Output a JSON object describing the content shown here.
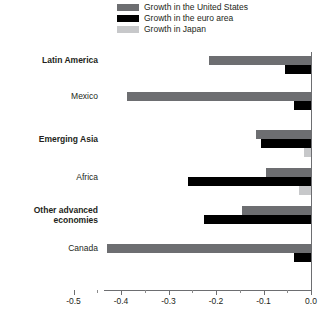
{
  "chart_data": {
    "type": "bar",
    "orientation": "horizontal",
    "title": "",
    "subtitle": "",
    "xlabel": "",
    "ylabel": "",
    "xlim": [
      -0.5,
      0.0
    ],
    "grid": false,
    "legend_position": "top-center",
    "xticks": [
      -0.5,
      -0.4,
      -0.3,
      -0.2,
      -0.1,
      0.0
    ],
    "xtick_labels": [
      "-0.5",
      "-0.4",
      "-0.3",
      "-0.2",
      "-0.1",
      "0.0"
    ],
    "xticks_minor": [
      -0.45,
      -0.35,
      -0.25,
      -0.15,
      -0.05
    ],
    "categories": [
      "Latin America",
      "Mexico",
      "Emerging Asia",
      "Africa",
      "Other advanced economies",
      "Canada"
    ],
    "category_styles": [
      "bold",
      "regular",
      "bold",
      "regular",
      "bold",
      "regular"
    ],
    "series": [
      {
        "name": "Growth in the United States",
        "color": "#6d6e71",
        "values": [
          -0.215,
          -0.387,
          -0.115,
          -0.095,
          -0.145,
          -0.43
        ]
      },
      {
        "name": "Growth in the euro area",
        "color": "#000000",
        "values": [
          -0.055,
          -0.035,
          -0.105,
          -0.26,
          -0.225,
          -0.035
        ]
      },
      {
        "name": "Growth in Japan",
        "color": "#c7c8ca",
        "values": [
          0.0,
          0.0,
          -0.015,
          -0.025,
          0.0,
          0.0
        ]
      }
    ]
  },
  "legend": {
    "items": [
      {
        "label": "Growth in the United States",
        "color": "#6d6e71"
      },
      {
        "label": "Growth in the euro area",
        "color": "#000000"
      },
      {
        "label": "Growth in Japan",
        "color": "#c7c8ca"
      }
    ]
  },
  "axis": {
    "labels": [
      "-0.5",
      "-0.4",
      "-0.3",
      "-0.2",
      "-0.1",
      "0.0"
    ]
  },
  "colors": {
    "united_states": "#6d6e71",
    "euro_area": "#000000",
    "japan": "#c7c8ca",
    "axis": "#6d6e71",
    "text": "#231f20",
    "background": "#ffffff"
  }
}
